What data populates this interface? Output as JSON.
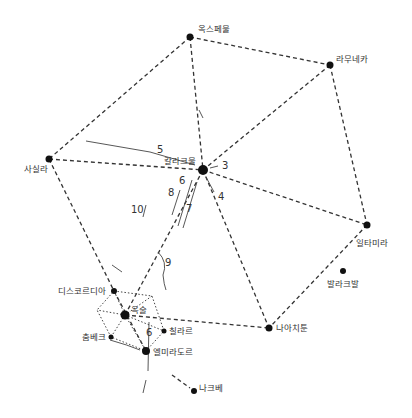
{
  "nodes": {
    "oxpemul": {
      "label": "옥스페물",
      "x": 190,
      "y": 37,
      "r": 3.5
    },
    "ramuneka": {
      "label": "라무네카",
      "x": 330,
      "y": 65,
      "r": 3.5
    },
    "sasilla": {
      "label": "사실라",
      "x": 49,
      "y": 159,
      "r": 3.5
    },
    "kallakmul": {
      "label": "칼라크물",
      "x": 203,
      "y": 170,
      "r": 5
    },
    "iltamira": {
      "label": "일타미라",
      "x": 367,
      "y": 225,
      "r": 3.5
    },
    "balakbal": {
      "label": "발라크발",
      "x": 343,
      "y": 271,
      "r": 3
    },
    "diskordia": {
      "label": "디스코르디아",
      "x": 114,
      "y": 291,
      "r": 3
    },
    "oksul": {
      "label": "옥술",
      "x": 125,
      "y": 315,
      "r": 4.5
    },
    "chillare": {
      "label": "칠라르",
      "x": 164,
      "y": 331,
      "r": 2.5
    },
    "chungbek": {
      "label": "춤베크",
      "x": 111,
      "y": 337,
      "r": 2.5
    },
    "naachitun": {
      "label": "나아치툰",
      "x": 269,
      "y": 328,
      "r": 3.5
    },
    "elmiradol": {
      "label": "엘미라도르",
      "x": 146,
      "y": 351,
      "r": 4
    },
    "nakbe": {
      "label": "나크베",
      "x": 194,
      "y": 391,
      "r": 3
    }
  },
  "route_labels": [
    {
      "text": "3",
      "x": 222,
      "y": 169
    },
    {
      "text": "4",
      "x": 218,
      "y": 200
    },
    {
      "text": "5",
      "x": 157,
      "y": 153
    },
    {
      "text": "6",
      "x": 179,
      "y": 184
    },
    {
      "text": "7",
      "x": 186,
      "y": 212
    },
    {
      "text": "8",
      "x": 168,
      "y": 196
    },
    {
      "text": "9",
      "x": 165,
      "y": 266
    },
    {
      "text": "10",
      "x": 131,
      "y": 213
    },
    {
      "text": "6",
      "x": 146,
      "y": 336
    }
  ]
}
